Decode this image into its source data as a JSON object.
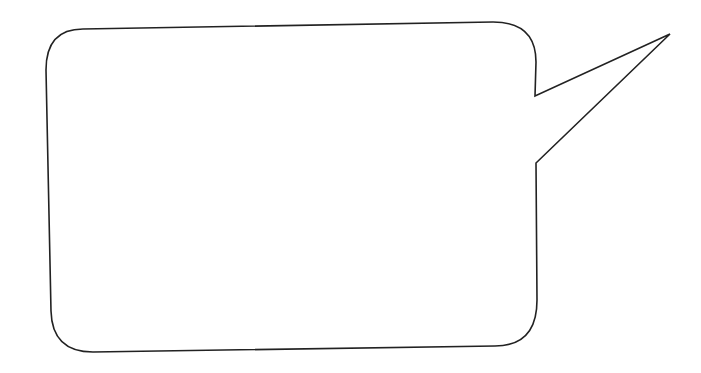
{
  "canvas": {
    "background": "#ffffff",
    "stroke": "#222222"
  },
  "speech_bubble": {
    "text": ""
  }
}
